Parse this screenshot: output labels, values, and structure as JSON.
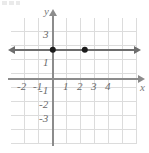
{
  "figure": {
    "axis_labels": {
      "x": "x",
      "y": "y"
    },
    "colors": {
      "grid": "#dcdcdc",
      "axis": "#8c8c8c",
      "plot_line": "#6e6e6e",
      "point": "#1c1c1c",
      "label_text": "#6b6b6b",
      "background": "#ffffff"
    }
  },
  "chart_data": {
    "type": "line",
    "title": "",
    "xlabel": "x",
    "ylabel": "y",
    "xlim": [
      -3,
      5
    ],
    "ylim": [
      -4,
      4
    ],
    "grid": true,
    "legend": "none",
    "x_tick_labels": [
      "-2",
      "-1",
      "1",
      "2",
      "3",
      "4"
    ],
    "x_tick_values": [
      -2,
      -1,
      1,
      2,
      3,
      4
    ],
    "y_tick_labels": [
      "3",
      "1",
      "-1",
      "-2",
      "-3"
    ],
    "y_tick_values": [
      3,
      1,
      -1,
      -2,
      -3
    ],
    "series": [
      {
        "name": "y = 2",
        "type": "line",
        "equation": "y = 2",
        "x": [
          -3,
          5
        ],
        "values": [
          2,
          2
        ],
        "arrow_left": true,
        "arrow_right": true
      }
    ],
    "points": [
      {
        "label": "(0, 2)",
        "x": 0,
        "y": 2
      },
      {
        "label": "(2, 2)",
        "x": 2,
        "y": 2
      }
    ],
    "annotations": []
  },
  "ticks": {
    "x": [
      {
        "label": "-2",
        "left": 17,
        "top": 81
      },
      {
        "label": "-1",
        "left": 33,
        "top": 81
      },
      {
        "label": "1",
        "left": 63,
        "top": 81
      },
      {
        "label": "2",
        "left": 77,
        "top": 81
      },
      {
        "label": "3",
        "left": 91,
        "top": 81
      },
      {
        "label": "4",
        "left": 105,
        "top": 81
      }
    ],
    "y": [
      {
        "label": "3",
        "left": 43,
        "top": 29
      },
      {
        "label": "1",
        "left": 43,
        "top": 57
      },
      {
        "label": "-1",
        "left": 39,
        "top": 85
      },
      {
        "label": "-2",
        "left": 39,
        "top": 99
      },
      {
        "label": "-3",
        "left": 39,
        "top": 113
      }
    ]
  },
  "point_positions": [
    {
      "name": "point-0-2",
      "left": 53,
      "top": 50
    },
    {
      "name": "point-2-2",
      "left": 85,
      "top": 50
    }
  ]
}
